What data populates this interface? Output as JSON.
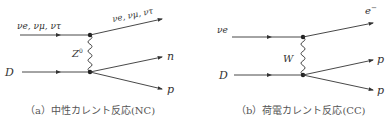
{
  "diagrams": [
    {
      "id": "nc",
      "incoming_top_label": "νe, νμ, ντ",
      "incoming_bottom_label": "D",
      "boson_label": "Z0",
      "boson_label_main": "Z",
      "boson_label_sup": "0",
      "outgoing_top_label": "νe, νμ, ντ",
      "outgoing_mid_label": "n",
      "outgoing_bottom_label": "p",
      "caption": "（a）中性カレント反応(NC)"
    },
    {
      "id": "cc",
      "incoming_top_label": "νe",
      "incoming_bottom_label": "D",
      "boson_label": "W",
      "outgoing_top_label": "e−",
      "outgoing_top_label_main": "e",
      "outgoing_top_label_sup": "−",
      "outgoing_mid_label": "p",
      "outgoing_bottom_label": "p",
      "caption": "（b）荷電カレント反応(CC)"
    }
  ],
  "colors": {
    "line": "#333333",
    "text": "#333333",
    "caption": "#555555",
    "background": "#ffffff"
  }
}
